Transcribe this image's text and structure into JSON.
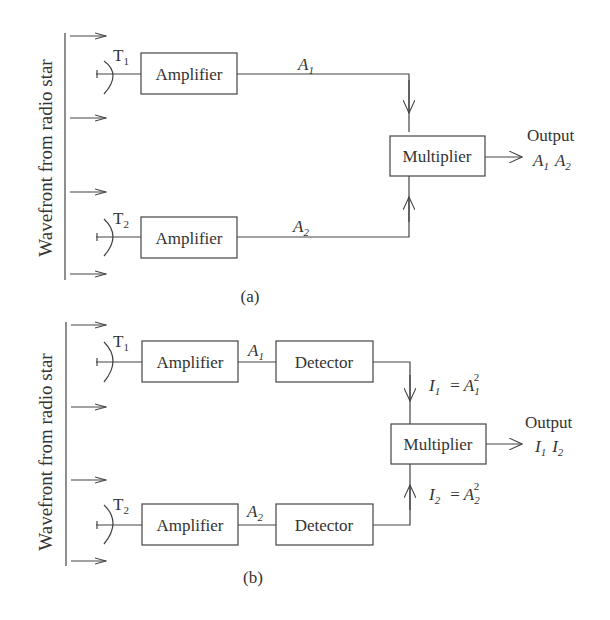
{
  "diagram_a": {
    "caption": "(a)",
    "wavefront_label": "Wavefront from radio star",
    "telescope_1": {
      "label": "T",
      "sub": "1"
    },
    "telescope_2": {
      "label": "T",
      "sub": "2"
    },
    "amplifier_1": "Amplifier",
    "amplifier_2": "Amplifier",
    "signal_1": {
      "label": "A",
      "sub": "1"
    },
    "signal_2": {
      "label": "A",
      "sub": "2"
    },
    "multiplier": "Multiplier",
    "output_title": "Output",
    "output_value": {
      "a": "A",
      "a_sub": "1",
      "b": "A",
      "b_sub": "2"
    }
  },
  "diagram_b": {
    "caption": "(b)",
    "wavefront_label": "Wavefront from radio star",
    "telescope_1": {
      "label": "T",
      "sub": "1"
    },
    "telescope_2": {
      "label": "T",
      "sub": "2"
    },
    "amplifier_1": "Amplifier",
    "amplifier_2": "Amplifier",
    "signal_1": {
      "label": "A",
      "sub": "1"
    },
    "signal_2": {
      "label": "A",
      "sub": "2"
    },
    "detector_1": "Detector",
    "detector_2": "Detector",
    "intensity_1": {
      "I": "I",
      "I_sub": "1",
      "eq": "=",
      "A": "A",
      "A_sub": "1",
      "exp": "2"
    },
    "intensity_2": {
      "I": "I",
      "I_sub": "2",
      "eq": "=",
      "A": "A",
      "A_sub": "2",
      "exp": "2"
    },
    "multiplier": "Multiplier",
    "output_title": "Output",
    "output_value": {
      "a": "I",
      "a_sub": "1",
      "b": "I",
      "b_sub": "2"
    }
  }
}
